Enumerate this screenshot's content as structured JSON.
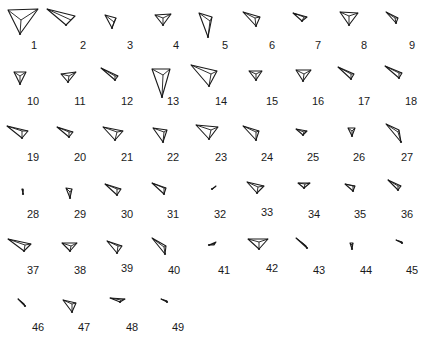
{
  "figure": {
    "stroke_color": "#1a1a1a",
    "background": "#ffffff",
    "glyphs": [
      {
        "label": "1",
        "lx": 34,
        "ly": 45,
        "outer": [
          [
            8,
            10
          ],
          [
            38,
            9
          ],
          [
            20,
            34
          ]
        ],
        "apex": [
          21,
          20
        ]
      },
      {
        "label": "2",
        "lx": 83,
        "ly": 45,
        "outer": [
          [
            47,
            9
          ],
          [
            75,
            16
          ],
          [
            66,
            25
          ]
        ],
        "apex": [
          71,
          20
        ]
      },
      {
        "label": "3",
        "lx": 130,
        "ly": 45,
        "outer": [
          [
            105,
            15
          ],
          [
            116,
            18
          ],
          [
            112,
            28
          ]
        ],
        "apex": [
          114,
          22
        ]
      },
      {
        "label": "4",
        "lx": 176,
        "ly": 45,
        "outer": [
          [
            155,
            15
          ],
          [
            171,
            14
          ],
          [
            163,
            25
          ]
        ],
        "apex": [
          163,
          18
        ]
      },
      {
        "label": "5",
        "lx": 225,
        "ly": 45,
        "outer": [
          [
            199,
            13
          ],
          [
            212,
            17
          ],
          [
            208,
            37
          ]
        ],
        "apex": [
          210,
          21
        ]
      },
      {
        "label": "6",
        "lx": 272,
        "ly": 45,
        "outer": [
          [
            243,
            12
          ],
          [
            260,
            17
          ],
          [
            256,
            26
          ]
        ],
        "apex": [
          255,
          18
        ]
      },
      {
        "label": "7",
        "lx": 318,
        "ly": 45,
        "outer": [
          [
            293,
            13
          ],
          [
            307,
            17
          ],
          [
            302,
            21
          ]
        ],
        "apex": [
          304,
          17
        ]
      },
      {
        "label": "8",
        "lx": 364,
        "ly": 45,
        "outer": [
          [
            340,
            12
          ],
          [
            358,
            13
          ],
          [
            349,
            25
          ]
        ],
        "apex": [
          349,
          16
        ]
      },
      {
        "label": "9",
        "lx": 412,
        "ly": 45,
        "outer": [
          [
            386,
            12
          ],
          [
            398,
            18
          ],
          [
            396,
            23
          ]
        ],
        "apex": [
          395,
          18
        ]
      },
      {
        "label": "10",
        "lx": 33,
        "ly": 101,
        "outer": [
          [
            14,
            72
          ],
          [
            26,
            72
          ],
          [
            20,
            84
          ]
        ],
        "apex": [
          20,
          76
        ]
      },
      {
        "label": "11",
        "lx": 80,
        "ly": 101,
        "outer": [
          [
            61,
            74
          ],
          [
            76,
            72
          ],
          [
            68,
            82
          ]
        ],
        "apex": [
          69,
          76
        ]
      },
      {
        "label": "12",
        "lx": 127,
        "ly": 101,
        "outer": [
          [
            101,
            68
          ],
          [
            118,
            76
          ],
          [
            115,
            80
          ]
        ],
        "apex": [
          115,
          76
        ]
      },
      {
        "label": "13",
        "lx": 173,
        "ly": 101,
        "outer": [
          [
            152,
            69
          ],
          [
            170,
            69
          ],
          [
            162,
            97
          ]
        ],
        "apex": [
          163,
          75
        ]
      },
      {
        "label": "14",
        "lx": 221,
        "ly": 101,
        "outer": [
          [
            191,
            65
          ],
          [
            217,
            71
          ],
          [
            209,
            86
          ]
        ],
        "apex": [
          211,
          74
        ]
      },
      {
        "label": "15",
        "lx": 272,
        "ly": 101,
        "outer": [
          [
            249,
            71
          ],
          [
            262,
            71
          ],
          [
            256,
            80
          ]
        ],
        "apex": [
          256,
          74
        ]
      },
      {
        "label": "16",
        "lx": 318,
        "ly": 101,
        "outer": [
          [
            296,
            70
          ],
          [
            311,
            70
          ],
          [
            303,
            81
          ]
        ],
        "apex": [
          304,
          74
        ]
      },
      {
        "label": "17",
        "lx": 364,
        "ly": 101,
        "outer": [
          [
            338,
            67
          ],
          [
            354,
            74
          ],
          [
            351,
            79
          ]
        ],
        "apex": [
          351,
          74
        ]
      },
      {
        "label": "18",
        "lx": 411,
        "ly": 101,
        "outer": [
          [
            385,
            66
          ],
          [
            402,
            73
          ],
          [
            399,
            78
          ]
        ],
        "apex": [
          399,
          73
        ]
      },
      {
        "label": "19",
        "lx": 33,
        "ly": 157,
        "outer": [
          [
            7,
            126
          ],
          [
            28,
            131
          ],
          [
            22,
            138
          ]
        ],
        "apex": [
          22,
          131
        ]
      },
      {
        "label": "20",
        "lx": 80,
        "ly": 157,
        "outer": [
          [
            57,
            127
          ],
          [
            73,
            132
          ],
          [
            69,
            137
          ]
        ],
        "apex": [
          69,
          132
        ]
      },
      {
        "label": "21",
        "lx": 127,
        "ly": 157,
        "outer": [
          [
            103,
            127
          ],
          [
            123,
            131
          ],
          [
            115,
            140
          ]
        ],
        "apex": [
          117,
          132
        ]
      },
      {
        "label": "22",
        "lx": 173,
        "ly": 157,
        "outer": [
          [
            153,
            128
          ],
          [
            167,
            130
          ],
          [
            163,
            142
          ]
        ],
        "apex": [
          164,
          132
        ]
      },
      {
        "label": "23",
        "lx": 221,
        "ly": 157,
        "outer": [
          [
            196,
            125
          ],
          [
            218,
            127
          ],
          [
            209,
            139
          ]
        ],
        "apex": [
          211,
          130
        ]
      },
      {
        "label": "24",
        "lx": 267,
        "ly": 157,
        "outer": [
          [
            243,
            126
          ],
          [
            259,
            131
          ],
          [
            256,
            140
          ]
        ],
        "apex": [
          256,
          132
        ]
      },
      {
        "label": "25",
        "lx": 313,
        "ly": 157,
        "outer": [
          [
            296,
            129
          ],
          [
            307,
            131
          ],
          [
            303,
            135
          ]
        ],
        "apex": [
          304,
          132
        ]
      },
      {
        "label": "26",
        "lx": 359,
        "ly": 157,
        "outer": [
          [
            348,
            128
          ],
          [
            355,
            128
          ],
          [
            352,
            136
          ]
        ],
        "apex": [
          352,
          131
        ]
      },
      {
        "label": "27",
        "lx": 407,
        "ly": 157,
        "outer": [
          [
            386,
            124
          ],
          [
            399,
            130
          ],
          [
            401,
            142
          ]
        ],
        "apex": [
          398,
          132
        ]
      },
      {
        "label": "28",
        "lx": 33,
        "ly": 214,
        "outer": [
          [
            22,
            189
          ],
          [
            23,
            189
          ],
          [
            23,
            194
          ]
        ],
        "apex": [
          23,
          191
        ]
      },
      {
        "label": "29",
        "lx": 80,
        "ly": 214,
        "outer": [
          [
            66,
            188
          ],
          [
            72,
            189
          ],
          [
            70,
            198
          ]
        ],
        "apex": [
          70,
          192
        ]
      },
      {
        "label": "30",
        "lx": 127,
        "ly": 214,
        "outer": [
          [
            105,
            184
          ],
          [
            121,
            189
          ],
          [
            117,
            195
          ]
        ],
        "apex": [
          117,
          189
        ]
      },
      {
        "label": "31",
        "lx": 173,
        "ly": 214,
        "outer": [
          [
            152,
            183
          ],
          [
            166,
            188
          ],
          [
            164,
            194
          ]
        ],
        "apex": [
          164,
          188
        ]
      },
      {
        "label": "32",
        "lx": 220,
        "ly": 214,
        "outer": [
          [
            212,
            189
          ],
          [
            216,
            186
          ],
          [
            215,
            187
          ]
        ],
        "apex": [
          214,
          188
        ]
      },
      {
        "label": "33",
        "lx": 267,
        "ly": 212,
        "outer": [
          [
            247,
            182
          ],
          [
            264,
            186
          ],
          [
            257,
            193
          ]
        ],
        "apex": [
          258,
          187
        ]
      },
      {
        "label": "34",
        "lx": 314,
        "ly": 214,
        "outer": [
          [
            298,
            183
          ],
          [
            310,
            183
          ],
          [
            304,
            188
          ]
        ],
        "apex": [
          305,
          184
        ]
      },
      {
        "label": "35",
        "lx": 360,
        "ly": 214,
        "outer": [
          [
            345,
            184
          ],
          [
            355,
            186
          ],
          [
            353,
            191
          ]
        ],
        "apex": [
          353,
          186
        ]
      },
      {
        "label": "36",
        "lx": 407,
        "ly": 214,
        "outer": [
          [
            388,
            180
          ],
          [
            401,
            186
          ],
          [
            398,
            190
          ]
        ],
        "apex": [
          398,
          186
        ]
      },
      {
        "label": "37",
        "lx": 33,
        "ly": 270,
        "outer": [
          [
            8,
            239
          ],
          [
            31,
            244
          ],
          [
            24,
            251
          ]
        ],
        "apex": [
          25,
          245
        ]
      },
      {
        "label": "38",
        "lx": 80,
        "ly": 270,
        "outer": [
          [
            62,
            243
          ],
          [
            77,
            243
          ],
          [
            70,
            251
          ]
        ],
        "apex": [
          71,
          246
        ]
      },
      {
        "label": "39",
        "lx": 127,
        "ly": 268,
        "outer": [
          [
            107,
            241
          ],
          [
            122,
            246
          ],
          [
            117,
            253
          ]
        ],
        "apex": [
          118,
          246
        ]
      },
      {
        "label": "40",
        "lx": 174,
        "ly": 270,
        "outer": [
          [
            152,
            238
          ],
          [
            166,
            246
          ],
          [
            165,
            254
          ]
        ],
        "apex": [
          164,
          247
        ]
      },
      {
        "label": "41",
        "lx": 224,
        "ly": 270,
        "outer": [
          [
            209,
            245
          ],
          [
            216,
            242
          ],
          [
            214,
            245
          ]
        ],
        "apex": [
          214,
          244
        ]
      },
      {
        "label": "42",
        "lx": 272,
        "ly": 268,
        "outer": [
          [
            248,
            239
          ],
          [
            268,
            239
          ],
          [
            259,
            249
          ]
        ],
        "apex": [
          259,
          242
        ]
      },
      {
        "label": "43",
        "lx": 319,
        "ly": 270,
        "outer": [
          [
            296,
            238
          ],
          [
            306,
            246
          ],
          [
            307,
            248
          ]
        ],
        "apex": [
          305,
          245
        ]
      },
      {
        "label": "44",
        "lx": 366,
        "ly": 270,
        "outer": [
          [
            350,
            243
          ],
          [
            353,
            243
          ],
          [
            352,
            249
          ]
        ],
        "apex": [
          352,
          245
        ]
      },
      {
        "label": "45",
        "lx": 412,
        "ly": 270,
        "outer": [
          [
            396,
            240
          ],
          [
            402,
            242
          ],
          [
            402,
            243
          ]
        ],
        "apex": [
          401,
          242
        ]
      },
      {
        "label": "46",
        "lx": 38,
        "ly": 327,
        "outer": [
          [
            18,
            299
          ],
          [
            24,
            304
          ],
          [
            25,
            306
          ]
        ],
        "apex": [
          24,
          304
        ]
      },
      {
        "label": "47",
        "lx": 84,
        "ly": 327,
        "outer": [
          [
            63,
            300
          ],
          [
            76,
            303
          ],
          [
            72,
            312
          ]
        ],
        "apex": [
          72,
          304
        ]
      },
      {
        "label": "48",
        "lx": 132,
        "ly": 327,
        "outer": [
          [
            110,
            298
          ],
          [
            125,
            299
          ],
          [
            120,
            302
          ]
        ],
        "apex": [
          121,
          300
        ]
      },
      {
        "label": "49",
        "lx": 178,
        "ly": 327,
        "outer": [
          [
            161,
            299
          ],
          [
            167,
            301
          ],
          [
            167,
            302
          ]
        ],
        "apex": [
          166,
          301
        ]
      }
    ]
  }
}
